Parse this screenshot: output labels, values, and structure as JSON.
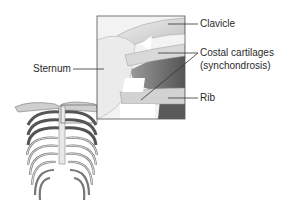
{
  "diagram": {
    "labels": {
      "clavicle": "Clavicle",
      "costal_line1": "Costal cartilages",
      "costal_line2": "(synchondrosis)",
      "sternum": "Sternum",
      "rib": "Rib"
    },
    "colors": {
      "line": "#333333",
      "inset_border": "#555555",
      "bone_light": "#e6e6e6",
      "bone_shadow": "#8a8a8a",
      "dark": "#4a4a4a"
    }
  }
}
